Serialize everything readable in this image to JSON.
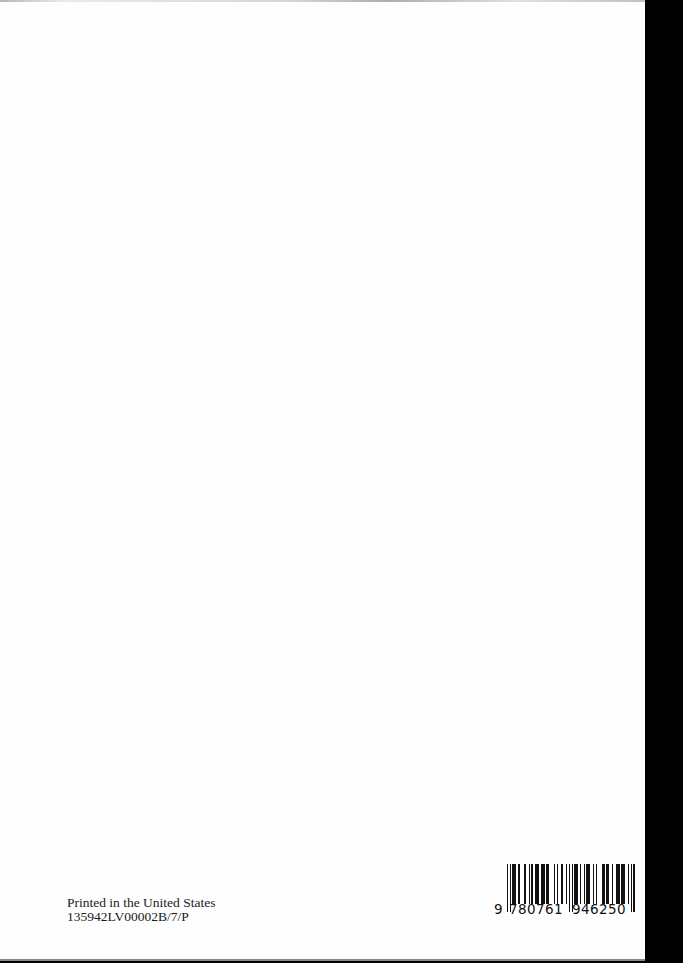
{
  "imprint": {
    "line1": "Printed in the United States",
    "line2": "135942LV00002B/7/P"
  },
  "barcode": {
    "lead_digit": "9",
    "left_group": "780761",
    "right_group": "946250",
    "full": "9780761946250"
  },
  "colors": {
    "page": "#fefefe",
    "background": "#000000",
    "text": "#1a1a1a"
  }
}
